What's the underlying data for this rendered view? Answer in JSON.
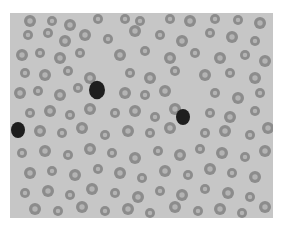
{
  "image": {
    "subject": "blood smear micrograph",
    "tone": "grayscale",
    "colors": {
      "background": "#c6c6c6",
      "cell_rim": "#8c8c8c",
      "cell_center": "#b4b4b4",
      "nucleus": "#1e1e1e",
      "border": "#ffffff"
    },
    "cells": [
      [
        20,
        8,
        6
      ],
      [
        42,
        8,
        5
      ],
      [
        60,
        12,
        6
      ],
      [
        88,
        6,
        5
      ],
      [
        115,
        6,
        5
      ],
      [
        130,
        8,
        5
      ],
      [
        160,
        6,
        5
      ],
      [
        180,
        8,
        6
      ],
      [
        205,
        6,
        5
      ],
      [
        228,
        7,
        5
      ],
      [
        250,
        10,
        6
      ],
      [
        18,
        22,
        5
      ],
      [
        38,
        20,
        5
      ],
      [
        55,
        28,
        6
      ],
      [
        75,
        22,
        6
      ],
      [
        98,
        26,
        5
      ],
      [
        125,
        18,
        6
      ],
      [
        150,
        22,
        5
      ],
      [
        172,
        28,
        6
      ],
      [
        200,
        20,
        5
      ],
      [
        222,
        24,
        6
      ],
      [
        245,
        28,
        5
      ],
      [
        12,
        42,
        6
      ],
      [
        30,
        40,
        5
      ],
      [
        50,
        45,
        6
      ],
      [
        70,
        40,
        5
      ],
      [
        110,
        42,
        6
      ],
      [
        135,
        38,
        5
      ],
      [
        160,
        45,
        6
      ],
      [
        185,
        40,
        5
      ],
      [
        210,
        45,
        6
      ],
      [
        235,
        42,
        5
      ],
      [
        255,
        48,
        6
      ],
      [
        15,
        60,
        5
      ],
      [
        35,
        62,
        6
      ],
      [
        58,
        58,
        5
      ],
      [
        80,
        65,
        6
      ],
      [
        120,
        60,
        5
      ],
      [
        140,
        65,
        6
      ],
      [
        165,
        58,
        5
      ],
      [
        195,
        62,
        6
      ],
      [
        220,
        60,
        5
      ],
      [
        245,
        65,
        6
      ],
      [
        10,
        80,
        6
      ],
      [
        28,
        78,
        5
      ],
      [
        50,
        82,
        6
      ],
      [
        68,
        75,
        5
      ],
      [
        115,
        80,
        6
      ],
      [
        135,
        82,
        5
      ],
      [
        155,
        78,
        6
      ],
      [
        205,
        80,
        5
      ],
      [
        228,
        85,
        6
      ],
      [
        250,
        80,
        5
      ],
      [
        20,
        100,
        5
      ],
      [
        40,
        98,
        6
      ],
      [
        60,
        102,
        5
      ],
      [
        80,
        96,
        6
      ],
      [
        105,
        100,
        5
      ],
      [
        125,
        98,
        6
      ],
      [
        145,
        104,
        5
      ],
      [
        165,
        96,
        6
      ],
      [
        200,
        100,
        5
      ],
      [
        220,
        104,
        6
      ],
      [
        245,
        98,
        5
      ],
      [
        30,
        118,
        6
      ],
      [
        52,
        120,
        5
      ],
      [
        72,
        115,
        6
      ],
      [
        95,
        122,
        5
      ],
      [
        118,
        118,
        6
      ],
      [
        140,
        120,
        5
      ],
      [
        160,
        115,
        6
      ],
      [
        195,
        120,
        5
      ],
      [
        215,
        118,
        6
      ],
      [
        240,
        122,
        5
      ],
      [
        258,
        115,
        6
      ],
      [
        12,
        140,
        5
      ],
      [
        35,
        138,
        6
      ],
      [
        58,
        142,
        5
      ],
      [
        80,
        136,
        6
      ],
      [
        102,
        140,
        5
      ],
      [
        125,
        145,
        6
      ],
      [
        148,
        138,
        5
      ],
      [
        170,
        142,
        6
      ],
      [
        190,
        136,
        5
      ],
      [
        212,
        140,
        6
      ],
      [
        235,
        144,
        5
      ],
      [
        255,
        138,
        6
      ],
      [
        20,
        160,
        6
      ],
      [
        42,
        158,
        5
      ],
      [
        65,
        162,
        6
      ],
      [
        88,
        156,
        5
      ],
      [
        110,
        160,
        6
      ],
      [
        132,
        165,
        5
      ],
      [
        155,
        158,
        6
      ],
      [
        178,
        162,
        5
      ],
      [
        200,
        156,
        6
      ],
      [
        222,
        160,
        5
      ],
      [
        245,
        164,
        6
      ],
      [
        15,
        180,
        5
      ],
      [
        38,
        178,
        6
      ],
      [
        60,
        182,
        5
      ],
      [
        82,
        176,
        6
      ],
      [
        105,
        180,
        5
      ],
      [
        128,
        184,
        6
      ],
      [
        150,
        178,
        5
      ],
      [
        172,
        182,
        6
      ],
      [
        195,
        176,
        5
      ],
      [
        218,
        180,
        6
      ],
      [
        240,
        184,
        5
      ],
      [
        25,
        196,
        6
      ],
      [
        48,
        198,
        5
      ],
      [
        72,
        194,
        6
      ],
      [
        95,
        198,
        5
      ],
      [
        118,
        196,
        6
      ],
      [
        140,
        200,
        5
      ],
      [
        165,
        194,
        6
      ],
      [
        188,
        198,
        5
      ],
      [
        210,
        196,
        6
      ],
      [
        232,
        200,
        5
      ],
      [
        255,
        194,
        6
      ]
    ],
    "nuclei": [
      [
        87,
        77,
        8
      ],
      [
        8,
        117,
        7
      ],
      [
        173,
        104,
        7
      ]
    ]
  }
}
